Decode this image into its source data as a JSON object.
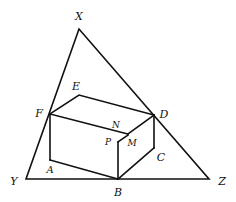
{
  "diagram": {
    "type": "geometry",
    "stroke_color": "#111111",
    "background": "#ffffff",
    "points": {
      "X": {
        "label": "X",
        "x": 79,
        "y": 29,
        "lx": 79,
        "ly": 20
      },
      "Y": {
        "label": "Y",
        "x": 26,
        "y": 179,
        "lx": 14,
        "ly": 185
      },
      "Z": {
        "label": "Z",
        "x": 209,
        "y": 179,
        "lx": 222,
        "ly": 185
      },
      "E": {
        "label": "E",
        "x": 79,
        "y": 95,
        "lx": 76,
        "ly": 90
      },
      "F": {
        "label": "F",
        "x": 50,
        "y": 114,
        "lx": 39,
        "ly": 117
      },
      "D": {
        "label": "D",
        "x": 154,
        "y": 115,
        "lx": 164,
        "ly": 118
      },
      "A": {
        "label": "A",
        "x": 50,
        "y": 160,
        "lx": 50,
        "ly": 173
      },
      "B": {
        "label": "B",
        "x": 118,
        "y": 179,
        "lx": 118,
        "ly": 196
      },
      "C": {
        "label": "C",
        "x": 154,
        "y": 148,
        "lx": 161,
        "ly": 161
      },
      "N": {
        "label": "N",
        "x": 128,
        "y": 134,
        "lx": 116,
        "ly": 128
      },
      "P": {
        "label": "P",
        "x": 118,
        "y": 142,
        "lx": 108,
        "ly": 145
      },
      "M": {
        "label": "M",
        "x": 128,
        "y": 134,
        "lx": 132,
        "ly": 146
      }
    },
    "labels": [
      "X",
      "Y",
      "Z",
      "E",
      "F",
      "D",
      "N",
      "P",
      "M",
      "A",
      "B",
      "C"
    ]
  }
}
